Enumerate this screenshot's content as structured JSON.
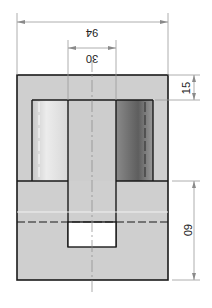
{
  "drawing": {
    "type": "technical-section-view",
    "dimensions": {
      "overall_width": "94",
      "bore_width": "30",
      "top_wall": "15",
      "lower_height": "60"
    },
    "colors": {
      "body_fill": "#cfcfcf",
      "outline": "#1a1a1a",
      "dim_line": "#9a9a9a",
      "cavity_light": "#e8e8e8",
      "cavity_dark": "#6a6a6a",
      "hole_fill": "#ffffff"
    }
  }
}
